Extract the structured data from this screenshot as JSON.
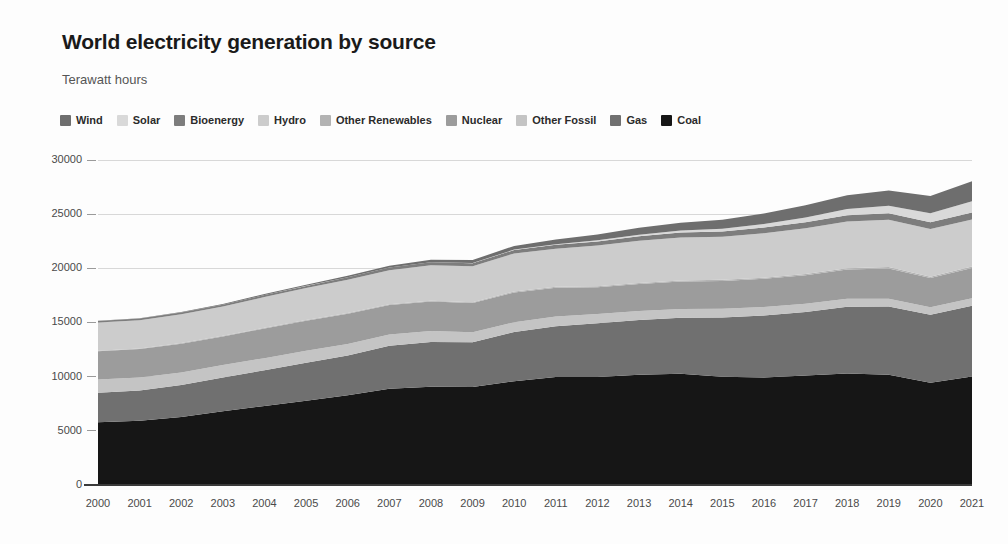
{
  "header": {
    "title": "World electricity generation by source",
    "subtitle": "Terawatt hours"
  },
  "chart_data": {
    "type": "area",
    "stacked": true,
    "title": "World electricity generation by source",
    "subtitle": "Terawatt hours",
    "xlabel": "",
    "ylabel": "Terawatt hours",
    "unit": "TWh",
    "grid": true,
    "legend_position": "top",
    "xlim": [
      2000,
      2021
    ],
    "ylim": [
      0,
      30000
    ],
    "yticks": [
      0,
      5000,
      10000,
      15000,
      20000,
      25000,
      30000
    ],
    "ytick_labels": [
      "0",
      "5000",
      "10000",
      "15000",
      "20000",
      "25000",
      "30000"
    ],
    "x": [
      2000,
      2001,
      2002,
      2003,
      2004,
      2005,
      2006,
      2007,
      2008,
      2009,
      2010,
      2011,
      2012,
      2013,
      2014,
      2015,
      2016,
      2017,
      2018,
      2019,
      2020,
      2021
    ],
    "xtick_labels": [
      "2000",
      "2001",
      "2002",
      "2003",
      "2004",
      "2005",
      "2006",
      "2007",
      "2008",
      "2009",
      "2010",
      "2011",
      "2012",
      "2013",
      "2014",
      "2015",
      "2016",
      "2017",
      "2018",
      "2019",
      "2020",
      "2021"
    ],
    "stack_order_bottom_to_top": [
      "Coal",
      "Gas",
      "Other Fossil",
      "Nuclear",
      "Other Renewables",
      "Hydro",
      "Bioenergy",
      "Solar",
      "Wind"
    ],
    "series": [
      {
        "name": "Wind",
        "color": "#6e6e6e",
        "values": [
          31,
          38,
          52,
          63,
          85,
          104,
          133,
          171,
          221,
          276,
          342,
          436,
          531,
          646,
          712,
          832,
          958,
          1130,
          1270,
          1420,
          1590,
          1860
        ]
      },
      {
        "name": "Solar",
        "color": "#d9d9d9",
        "values": [
          1,
          1,
          2,
          2,
          3,
          4,
          5,
          7,
          12,
          20,
          32,
          63,
          99,
          141,
          191,
          250,
          328,
          445,
          572,
          693,
          844,
          1030
        ]
      },
      {
        "name": "Bioenergy",
        "color": "#7d7d7d",
        "values": [
          131,
          142,
          155,
          168,
          184,
          201,
          221,
          242,
          266,
          289,
          321,
          352,
          386,
          420,
          457,
          489,
          519,
          545,
          572,
          597,
          620,
          650
        ]
      },
      {
        "name": "Hydro",
        "color": "#cccccc",
        "values": [
          2619,
          2608,
          2654,
          2700,
          2843,
          2955,
          3077,
          3145,
          3277,
          3307,
          3514,
          3527,
          3756,
          3895,
          3958,
          3966,
          4106,
          4214,
          4317,
          4358,
          4400,
          4327
        ]
      },
      {
        "name": "Other Renewables",
        "color": "#b3b3b3",
        "values": [
          53,
          55,
          57,
          60,
          63,
          66,
          69,
          73,
          77,
          80,
          84,
          88,
          93,
          97,
          102,
          106,
          111,
          116,
          121,
          126,
          131,
          138
        ]
      },
      {
        "name": "Nuclear",
        "color": "#9c9c9c",
        "values": [
          2591,
          2636,
          2660,
          2635,
          2738,
          2768,
          2793,
          2719,
          2731,
          2697,
          2756,
          2654,
          2462,
          2478,
          2535,
          2571,
          2611,
          2640,
          2702,
          2796,
          2700,
          2800
        ]
      },
      {
        "name": "Other Fossil",
        "color": "#c4c4c4",
        "values": [
          1240,
          1190,
          1160,
          1150,
          1120,
          1110,
          1060,
          1030,
          1000,
          930,
          900,
          890,
          870,
          840,
          820,
          800,
          780,
          760,
          740,
          720,
          680,
          700
        ]
      },
      {
        "name": "Gas",
        "color": "#707070",
        "values": [
          2705,
          2800,
          2960,
          3120,
          3290,
          3500,
          3670,
          3970,
          4130,
          4120,
          4540,
          4680,
          4960,
          5050,
          5160,
          5480,
          5720,
          5870,
          6150,
          6300,
          6280,
          6520
        ]
      },
      {
        "name": "Coal",
        "color": "#161616",
        "values": [
          5800,
          5930,
          6270,
          6810,
          7300,
          7780,
          8280,
          8890,
          9080,
          9050,
          9580,
          9980,
          9960,
          10180,
          10270,
          9990,
          9920,
          10100,
          10300,
          10180,
          9440,
          10020
        ]
      }
    ]
  },
  "legend": {
    "items": [
      {
        "label": "Wind",
        "color": "#6e6e6e"
      },
      {
        "label": "Solar",
        "color": "#d9d9d9"
      },
      {
        "label": "Bioenergy",
        "color": "#7d7d7d"
      },
      {
        "label": "Hydro",
        "color": "#cccccc"
      },
      {
        "label": "Other Renewables",
        "color": "#b3b3b3"
      },
      {
        "label": "Nuclear",
        "color": "#9c9c9c"
      },
      {
        "label": "Other Fossil",
        "color": "#c4c4c4"
      },
      {
        "label": "Gas",
        "color": "#707070"
      },
      {
        "label": "Coal",
        "color": "#161616"
      }
    ]
  },
  "axes": {
    "grid_color": "#d8d8d8",
    "axis_color": "#3a3a3a",
    "tick_text_color": "#4a4a4a"
  }
}
